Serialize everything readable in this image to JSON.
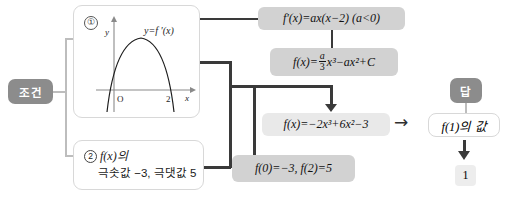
{
  "labels": {
    "condition_badge": "조건",
    "answer_badge": "답"
  },
  "conditions": [
    {
      "marker": "①",
      "graph": {
        "y_axis_label": "y",
        "x_axis_label": "x",
        "origin_label": "O",
        "x_tick_label": "2",
        "curve_label": "y=f′(x)"
      }
    },
    {
      "marker": "②",
      "line1": "f(x)의",
      "line2": "극솟값 −3, 극댓값 5"
    }
  ],
  "steps": {
    "derivative": "f′(x)=ax(x−2)  (a<0)",
    "antiderivative_lhs": "f(x)=",
    "antiderivative_frac_num": "a",
    "antiderivative_frac_den": "3",
    "antiderivative_rhs": "x³−ax²+C",
    "values": "f(0)=−3, f(2)=5",
    "result": "f(x)=−2x³+6x²−3"
  },
  "answer": {
    "question": "f(1)의 값",
    "value": "1"
  },
  "colors": {
    "badge_gray": "#8c8c8c",
    "box_gray": "#d2d2d2",
    "box_light": "#e9e9e9",
    "connector_light": "#bdbdbd",
    "connector_dark": "#3a3a3a"
  }
}
